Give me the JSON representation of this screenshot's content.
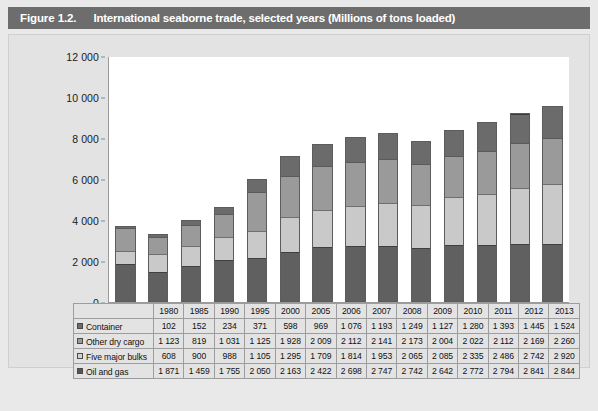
{
  "figure": {
    "number": "Figure 1.2.",
    "title": "International seaborne trade, selected years (Millions of tons loaded)"
  },
  "colors": {
    "title_bar": "#6d6d6d",
    "panel_bg": "#e3e3e3",
    "plot_bg": "#ffffff",
    "container": "#6b6b6b",
    "other_dry_cargo": "#9a9a9a",
    "five_major_bulks": "#c9c9c9",
    "oil_and_gas": "#606060"
  },
  "chart_data": {
    "type": "bar",
    "stacked": true,
    "title": "International seaborne trade, selected years (Millions of tons loaded)",
    "xlabel": "",
    "ylabel": "",
    "ylim": [
      0,
      12000
    ],
    "yticks": [
      0,
      2000,
      4000,
      6000,
      8000,
      10000,
      12000
    ],
    "ytick_labels": [
      "0",
      "2 000",
      "4 000",
      "6 000",
      "8 000",
      "10 000",
      "12 000"
    ],
    "grid": false,
    "legend_position": "table-row-labels",
    "categories": [
      "1980",
      "1985",
      "1990",
      "1995",
      "2000",
      "2005",
      "2006",
      "2007",
      "2008",
      "2009",
      "2010",
      "2011",
      "2012",
      "2013"
    ],
    "stack_order_bottom_to_top": [
      "Oil and gas",
      "Five major bulks",
      "Other dry cargo",
      "Container"
    ],
    "series": [
      {
        "name": "Container",
        "key": "container",
        "values": [
          102,
          152,
          234,
          371,
          598,
          969,
          1076,
          1193,
          1249,
          1127,
          1280,
          1393,
          1445,
          1524
        ],
        "labels": [
          "102",
          "152",
          "234",
          "371",
          "598",
          "969",
          "1 076",
          "1 193",
          "1 249",
          "1 127",
          "1 280",
          "1 393",
          "1 445",
          "1 524"
        ]
      },
      {
        "name": "Other dry cargo",
        "key": "other_dry_cargo",
        "values": [
          1123,
          819,
          1031,
          1125,
          1928,
          2009,
          2112,
          2141,
          2173,
          2004,
          2022,
          2112,
          2169,
          2260
        ],
        "labels": [
          "1 123",
          "819",
          "1 031",
          "1 125",
          "1 928",
          "2 009",
          "2 112",
          "2 141",
          "2 173",
          "2 004",
          "2 022",
          "2 112",
          "2 169",
          "2 260"
        ]
      },
      {
        "name": "Five major bulks",
        "key": "five_major_bulks",
        "values": [
          608,
          900,
          988,
          1105,
          1295,
          1709,
          1814,
          1953,
          2065,
          2085,
          2335,
          2486,
          2742,
          2920
        ],
        "labels": [
          "608",
          "900",
          "988",
          "1 105",
          "1 295",
          "1 709",
          "1 814",
          "1 953",
          "2 065",
          "2 085",
          "2 335",
          "2 486",
          "2 742",
          "2 920"
        ]
      },
      {
        "name": "Oil and gas",
        "key": "oil_and_gas",
        "values": [
          1871,
          1459,
          1755,
          2050,
          2163,
          2422,
          2698,
          2747,
          2742,
          2642,
          2772,
          2794,
          2841,
          2844
        ],
        "labels": [
          "1 871",
          "1 459",
          "1 755",
          "2 050",
          "2 163",
          "2 422",
          "2 698",
          "2 747",
          "2 742",
          "2 642",
          "2 772",
          "2 794",
          "2 841",
          "2 844"
        ]
      }
    ],
    "totals": [
      3704,
      3330,
      4008,
      4651,
      5984,
      7109,
      7700,
      8034,
      8229,
      7858,
      8409,
      8785,
      9197,
      9548
    ]
  },
  "table": {
    "corner_label": "",
    "column_headers": [
      "1980",
      "1985",
      "1990",
      "1995",
      "2000",
      "2005",
      "2006",
      "2007",
      "2008",
      "2009",
      "2010",
      "2011",
      "2012",
      "2013"
    ],
    "rows": [
      {
        "label": "Container",
        "swatch": "container-swatch",
        "cells": [
          "102",
          "152",
          "234",
          "371",
          "598",
          "969",
          "1 076",
          "1 193",
          "1 249",
          "1 127",
          "1 280",
          "1 393",
          "1 445",
          "1 524"
        ]
      },
      {
        "label": "Other dry cargo",
        "swatch": "other-dry-cargo-swatch",
        "cells": [
          "1 123",
          "819",
          "1 031",
          "1 125",
          "1 928",
          "2 009",
          "2 112",
          "2 141",
          "2 173",
          "2 004",
          "2 022",
          "2 112",
          "2 169",
          "2 260"
        ]
      },
      {
        "label": "Five major bulks",
        "swatch": "five-major-bulks-swatch",
        "cells": [
          "608",
          "900",
          "988",
          "1 105",
          "1 295",
          "1 709",
          "1 814",
          "1 953",
          "2 065",
          "2 085",
          "2 335",
          "2 486",
          "2 742",
          "2 920"
        ]
      },
      {
        "label": "Oil and gas",
        "swatch": "oil-and-gas-swatch",
        "cells": [
          "1 871",
          "1 459",
          "1 755",
          "2 050",
          "2 163",
          "2 422",
          "2 698",
          "2 747",
          "2 742",
          "2 642",
          "2 772",
          "2 794",
          "2 841",
          "2 844"
        ]
      }
    ]
  }
}
